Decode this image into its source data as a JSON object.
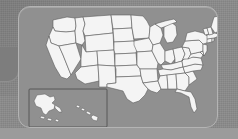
{
  "panel": {
    "name": "us-map-panel",
    "background_color": "#909090",
    "border_color": "#b4b4b4",
    "corner_radius_px": 12
  },
  "page": {
    "background_color": "#8b8b8b",
    "bottom_band_color": "#9b9b9b"
  },
  "map": {
    "title": "United States",
    "land_fill_color": "#f4f4f4",
    "border_stroke_color": "#545454",
    "projection_note": "contiguous 48 states with Alaska and Hawaii inset",
    "inset": {
      "name": "alaska-hawaii-inset",
      "frame_color": "#4a4a4a",
      "regions": [
        "Alaska",
        "Aleutian Islands",
        "Hawaii"
      ]
    },
    "regions": [
      "Washington",
      "Oregon",
      "California",
      "Nevada",
      "Idaho",
      "Montana",
      "Wyoming",
      "Utah",
      "Arizona",
      "Colorado",
      "New Mexico",
      "North Dakota",
      "South Dakota",
      "Nebraska",
      "Kansas",
      "Oklahoma",
      "Texas",
      "Minnesota",
      "Iowa",
      "Missouri",
      "Arkansas",
      "Louisiana",
      "Wisconsin",
      "Illinois",
      "Michigan",
      "Indiana",
      "Ohio",
      "Kentucky",
      "Tennessee",
      "Mississippi",
      "Alabama",
      "Georgia",
      "Florida",
      "South Carolina",
      "North Carolina",
      "Virginia",
      "West Virginia",
      "Maryland",
      "Delaware",
      "Pennsylvania",
      "New Jersey",
      "New York",
      "Connecticut",
      "Rhode Island",
      "Massachusetts",
      "Vermont",
      "New Hampshire",
      "Maine"
    ]
  },
  "left_stub": {
    "name": "clipped-left-panel",
    "color": "#7d7d7d"
  }
}
